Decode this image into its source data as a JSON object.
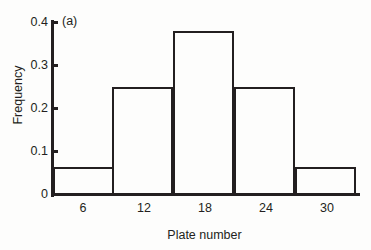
{
  "panel": {
    "label": "(a)"
  },
  "axes": {
    "x_title": "Plate number",
    "y_title": "Frequency",
    "y_ticks": [
      "0.4",
      "0.3",
      "0.2",
      "0.1",
      "0"
    ],
    "x_ticks": [
      "6",
      "12",
      "18",
      "24",
      "30"
    ]
  },
  "colors": {
    "line": "#231f20",
    "background": "#fdfdfc",
    "bar_fill": "transparent"
  },
  "chart_data": {
    "type": "bar",
    "title": "(a)",
    "subtitle": "",
    "xlabel": "Plate number",
    "ylabel": "Frequency",
    "categories": [
      "6",
      "12",
      "18",
      "24",
      "30"
    ],
    "values": [
      0.065,
      0.25,
      0.38,
      0.25,
      0.065
    ],
    "bin_edges": [
      3,
      9,
      15,
      21,
      27,
      33
    ],
    "bin_width": 6,
    "xlim": [
      3,
      33
    ],
    "ylim": [
      0,
      0.4
    ],
    "xticks": [
      6,
      12,
      18,
      24,
      30
    ],
    "yticks": [
      0,
      0.1,
      0.2,
      0.3,
      0.4
    ],
    "grid": false,
    "legend": false,
    "legend_position": "none",
    "annotations": [
      "(a)"
    ]
  }
}
